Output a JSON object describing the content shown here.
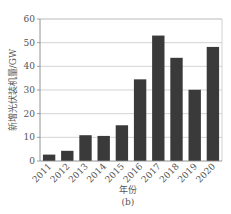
{
  "chart_data": {
    "type": "bar",
    "title": "",
    "subtitle": "(b)",
    "xlabel": "年份",
    "ylabel": "新增光伏装机量/GW",
    "categories": [
      "2011",
      "2012",
      "2013",
      "2014",
      "2015",
      "2016",
      "2017",
      "2018",
      "2019",
      "2020"
    ],
    "values": [
      2.7,
      4.3,
      10.9,
      10.6,
      15.1,
      34.5,
      53.0,
      43.6,
      30.1,
      48.2
    ],
    "ylim": [
      0,
      60
    ],
    "yticks": [
      0,
      10,
      20,
      30,
      40,
      50,
      60
    ],
    "grid": true,
    "legend": null,
    "colors": {
      "bar": "#3a3a3a",
      "grid": "#c8c8c8",
      "axis": "#888888",
      "frame": "#c8c8c8"
    }
  }
}
